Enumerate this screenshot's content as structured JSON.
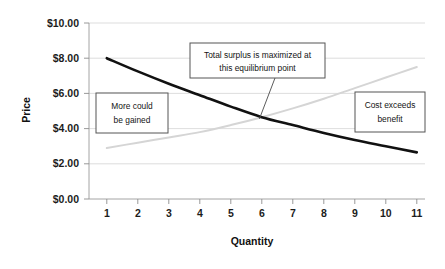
{
  "chart_data": {
    "type": "line",
    "title": "",
    "xlabel": "Quantity",
    "ylabel": "Price",
    "xlim": [
      1,
      11
    ],
    "ylim": [
      0,
      10
    ],
    "grid": true,
    "legend_position": "none",
    "x": [
      1,
      2,
      3,
      4,
      5,
      6,
      7,
      8,
      9,
      10,
      11
    ],
    "xtick_labels": [
      "1",
      "2",
      "3",
      "4",
      "5",
      "6",
      "7",
      "8",
      "9",
      "10",
      "11"
    ],
    "ytick_labels": [
      "$0.00",
      "$2.00",
      "$4.00",
      "$6.00",
      "$8.00",
      "$10.00"
    ],
    "ytick_values": [
      0,
      2,
      4,
      6,
      8,
      10
    ],
    "series": [
      {
        "name": "Demand",
        "color": "#111111",
        "values": [
          8.0,
          7.25,
          6.55,
          5.9,
          5.25,
          4.65,
          4.2,
          3.75,
          3.35,
          3.0,
          2.65
        ]
      },
      {
        "name": "Supply",
        "color": "#d5d5d5",
        "values": [
          2.9,
          3.2,
          3.5,
          3.8,
          4.2,
          4.65,
          5.15,
          5.7,
          6.3,
          6.9,
          7.5
        ]
      }
    ],
    "annotations": [
      {
        "id": "more-could-be-gained",
        "lines": [
          "More could",
          "be gained"
        ],
        "x": 2.35,
        "y": 5.55
      },
      {
        "id": "total-surplus-equilibrium",
        "lines": [
          "Total surplus is maximized at",
          "this equilibrium point"
        ],
        "x": 6.7,
        "y": 8.55,
        "points_to": {
          "x": 6.05,
          "y": 4.65
        }
      },
      {
        "id": "cost-exceeds-benefit",
        "lines": [
          "Cost exceeds",
          "benefit"
        ],
        "x": 10.0,
        "y": 5.5
      }
    ],
    "equilibrium": {
      "quantity": 6,
      "price": 4.65
    }
  }
}
